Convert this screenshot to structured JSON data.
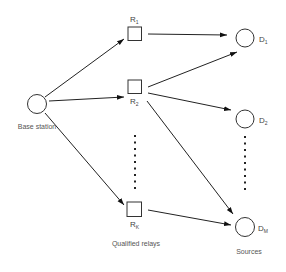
{
  "diagram": {
    "type": "network-topology",
    "base_station": {
      "label": "Base station",
      "shape": "circle"
    },
    "relays": {
      "caption": "Qualified relays",
      "shape": "square",
      "items": [
        {
          "id": "R1",
          "main": "R",
          "sub": "1"
        },
        {
          "id": "R2",
          "main": "R",
          "sub": "2"
        },
        {
          "id": "RK",
          "main": "R",
          "sub": "K"
        }
      ]
    },
    "sources": {
      "caption": "Sources",
      "shape": "circle",
      "items": [
        {
          "id": "D1",
          "main": "D",
          "sub": "1"
        },
        {
          "id": "D2",
          "main": "D",
          "sub": "2"
        },
        {
          "id": "DM",
          "main": "D",
          "sub": "M"
        }
      ]
    },
    "edges": [
      {
        "from": "Base station",
        "to": "R1"
      },
      {
        "from": "Base station",
        "to": "R2"
      },
      {
        "from": "Base station",
        "to": "RK"
      },
      {
        "from": "R1",
        "to": "D1"
      },
      {
        "from": "R2",
        "to": "D1"
      },
      {
        "from": "R2",
        "to": "D2"
      },
      {
        "from": "R2",
        "to": "DM"
      },
      {
        "from": "RK",
        "to": "DM"
      }
    ],
    "colors": {
      "stroke": "#333333",
      "text": "#444444",
      "background": "#ffffff"
    }
  }
}
